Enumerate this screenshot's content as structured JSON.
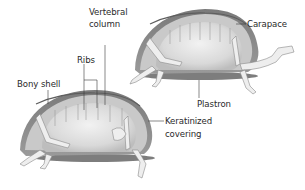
{
  "diagram": {
    "colors": {
      "shell_dark": "#6e6e6e",
      "shell_mid": "#a8a8a8",
      "shell_light": "#d6d6d6",
      "cavity": "#e6e6e6",
      "bone": "#efefef",
      "leader_line": "#3a3a3a",
      "text": "#2a2a2a"
    },
    "labels": {
      "vertebral_line1": "Vertebral",
      "vertebral_line2": "column",
      "ribs": "Ribs",
      "bony_shell": "Bony shell",
      "carapace": "Carapace",
      "plastron": "Plastron",
      "keratinized_line1": "Keratinized",
      "keratinized_line2": "covering"
    },
    "figures": [
      {
        "name": "upper-right-turtle",
        "view": "cutaway side view"
      },
      {
        "name": "lower-left-turtle",
        "view": "cutaway side view"
      }
    ]
  }
}
